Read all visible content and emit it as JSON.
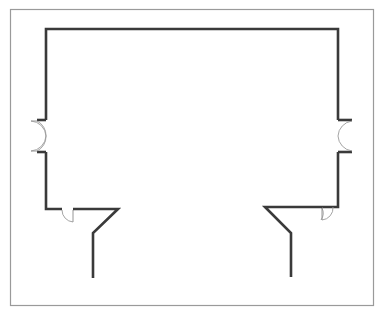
{
  "diagram": {
    "type": "floor-plan",
    "title": "",
    "colors": {
      "wall": "#3a3a3a",
      "frame": "#9a9a9a",
      "door": "#9a9a9a",
      "background": "#ffffff"
    },
    "elements": [
      {
        "name": "outer-frame"
      },
      {
        "name": "room-walls"
      },
      {
        "name": "left-double-door"
      },
      {
        "name": "right-double-door"
      },
      {
        "name": "bottom-left-door"
      },
      {
        "name": "bottom-right-door"
      },
      {
        "name": "left-corridor-wall"
      },
      {
        "name": "right-corridor-wall"
      }
    ]
  }
}
